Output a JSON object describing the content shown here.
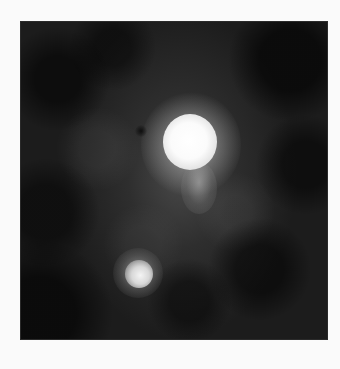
{
  "image": {
    "kind": "astronomical-photograph",
    "colors": {
      "page_background": "#fafafa",
      "field_background": "#1c1c1c",
      "halo": "#6e6e6e",
      "primary_source": "#ffffff",
      "secondary_source": "#f4f4f4"
    },
    "objects": [
      {
        "name": "primary-bright-source",
        "center": [
          188,
          140
        ],
        "radius": 28
      },
      {
        "name": "primary-source-tail",
        "center": [
          198,
          185
        ],
        "radius": 18
      },
      {
        "name": "secondary-bright-source",
        "center": [
          137,
          272
        ],
        "radius": 14
      },
      {
        "name": "dark-knot",
        "center": [
          141,
          131
        ],
        "radius": 5
      },
      {
        "name": "diffuse-halo",
        "center": [
          180,
          175
        ],
        "radius": 120
      }
    ]
  }
}
